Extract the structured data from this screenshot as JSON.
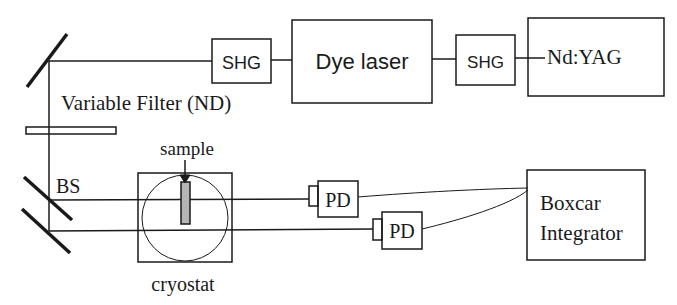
{
  "diagram": {
    "type": "optical-setup",
    "components": {
      "shg1": {
        "label": "SHG"
      },
      "dye_laser": {
        "label": "Dye laser"
      },
      "shg2": {
        "label": "SHG"
      },
      "nd_yag": {
        "label": "Nd:YAG"
      },
      "variable_filter": {
        "label": "Variable Filter (ND)"
      },
      "beam_splitter": {
        "label": "BS"
      },
      "sample": {
        "label": "sample"
      },
      "cryostat": {
        "label": "cryostat"
      },
      "pd1": {
        "label": "PD"
      },
      "pd2": {
        "label": "PD"
      },
      "boxcar": {
        "line1": "Boxcar",
        "line2": "Integrator"
      }
    },
    "colors": {
      "stroke": "#1a1a1a",
      "sample_fill": "#b5b5b5",
      "background": "#ffffff"
    }
  }
}
